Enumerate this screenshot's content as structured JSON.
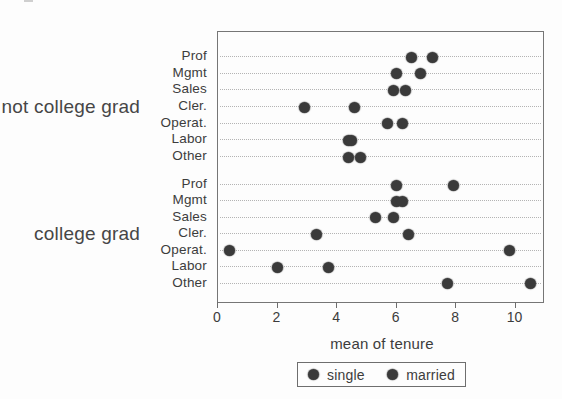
{
  "chart_data": {
    "type": "scatter",
    "variant": "dot-plot",
    "title": "",
    "xlabel": "mean of tenure",
    "ylabel": "",
    "xlim": [
      0,
      10.92
    ],
    "xticks": [
      0,
      2,
      4,
      6,
      8,
      10
    ],
    "grid": "horizontal-dotted",
    "legend_position": "bottom-center",
    "series_names": [
      "single",
      "married"
    ],
    "groups": [
      {
        "label": "not college grad",
        "categories": [
          "Prof",
          "Mgmt",
          "Sales",
          "Cler.",
          "Operat.",
          "Labor",
          "Other"
        ],
        "series": [
          {
            "name": "single",
            "values": [
              6.5,
              6.0,
              5.9,
              2.9,
              5.7,
              4.4,
              4.4
            ]
          },
          {
            "name": "married",
            "values": [
              7.2,
              6.8,
              6.3,
              4.6,
              6.2,
              4.5,
              4.8
            ]
          }
        ]
      },
      {
        "label": "college grad",
        "categories": [
          "Prof",
          "Mgmt",
          "Sales",
          "Cler.",
          "Operat.",
          "Labor",
          "Other"
        ],
        "series": [
          {
            "name": "single",
            "values": [
              6.0,
              6.0,
              5.3,
              3.3,
              0.4,
              2.0,
              7.7
            ]
          },
          {
            "name": "married",
            "values": [
              7.9,
              6.2,
              5.9,
              6.4,
              9.8,
              3.7,
              10.5
            ]
          }
        ]
      }
    ]
  },
  "colors": {
    "dot": "#3a3a3a",
    "grid_line": "#b4b4b4",
    "plot_border": "#767676",
    "text": "#3c3c3c",
    "background": "#fdfdfd"
  }
}
